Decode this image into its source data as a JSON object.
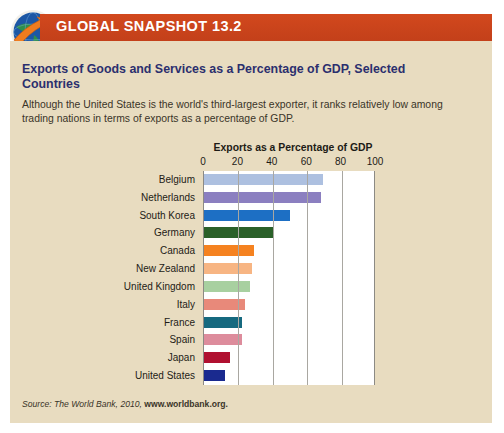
{
  "banner": {
    "label": "GLOBAL SNAPSHOT 13.2",
    "icon": "globe-arrow-icon",
    "color": "#c9441c"
  },
  "header": {
    "title": "Exports of Goods and Services as a Percentage of GDP, Selected Countries",
    "description": "Although the United States is the world's third-largest exporter, it ranks relatively low among trading nations in terms of exports as a percentage of GDP.",
    "title_color": "#2b2f6e"
  },
  "source": {
    "prefix": "Source: The World Bank, 2010, ",
    "url": "www.worldbank.org."
  },
  "chart_data": {
    "type": "bar",
    "orientation": "horizontal",
    "title": "Exports as a Percentage of GDP",
    "xlabel": "",
    "ylabel": "",
    "xlim": [
      0,
      100
    ],
    "xticks": [
      0,
      20,
      40,
      60,
      80,
      100
    ],
    "grid": true,
    "legend": "none",
    "categories": [
      "Belgium",
      "Netherlands",
      "South Korea",
      "Germany",
      "Canada",
      "New Zealand",
      "United Kingdom",
      "Italy",
      "France",
      "Spain",
      "Japan",
      "United States"
    ],
    "values": [
      69,
      68,
      50,
      40,
      29,
      28,
      27,
      24,
      22,
      22,
      15,
      12
    ],
    "colors": [
      "#adc0e0",
      "#8b7fc0",
      "#1d6fc4",
      "#2a6029",
      "#f58220",
      "#f7b583",
      "#a8d0a0",
      "#e8897a",
      "#16697f",
      "#dd8c9c",
      "#b01030",
      "#1a2a8f"
    ]
  }
}
